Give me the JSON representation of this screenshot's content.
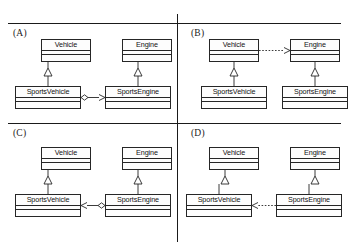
{
  "figure": {
    "line_color": "#1a1a1a",
    "box_border_color": "#262626",
    "box_fill_color": "#fdfdfd",
    "background_color": "#ffffff"
  },
  "classes": {
    "vehicle": "Vehicle",
    "engine": "Engine",
    "sports_vehicle": "SportsVehicle",
    "sports_engine": "SportsEngine"
  },
  "panels": [
    {
      "id": "a",
      "label": "(A)",
      "boxes": [
        {
          "name": "Vehicle",
          "role": "superclass-left"
        },
        {
          "name": "Engine",
          "role": "superclass-right"
        },
        {
          "name": "SportsVehicle",
          "role": "subclass-left"
        },
        {
          "name": "SportsEngine",
          "role": "subclass-right"
        }
      ],
      "relationships": [
        {
          "type": "generalization",
          "from": "SportsVehicle",
          "to": "Vehicle",
          "notation": "solid line with hollow triangle"
        },
        {
          "type": "generalization",
          "from": "SportsEngine",
          "to": "Engine",
          "notation": "solid line with hollow triangle"
        },
        {
          "type": "aggregation",
          "from": "SportsVehicle",
          "to": "SportsEngine",
          "notation": "solid line, hollow diamond at SportsVehicle, open arrowhead at SportsEngine"
        }
      ]
    },
    {
      "id": "b",
      "label": "(B)",
      "boxes": [
        {
          "name": "Vehicle",
          "role": "superclass-left"
        },
        {
          "name": "Engine",
          "role": "superclass-right"
        },
        {
          "name": "SportsVehicle",
          "role": "subclass-left"
        },
        {
          "name": "SportsEngine",
          "role": "subclass-right"
        }
      ],
      "relationships": [
        {
          "type": "generalization",
          "from": "SportsVehicle",
          "to": "Vehicle",
          "notation": "solid line with hollow triangle"
        },
        {
          "type": "generalization",
          "from": "SportsEngine",
          "to": "Engine",
          "notation": "solid line with hollow triangle"
        },
        {
          "type": "dependency",
          "from": "Vehicle",
          "to": "Engine",
          "notation": "dotted line with open arrowhead pointing right"
        }
      ]
    },
    {
      "id": "c",
      "label": "(C)",
      "boxes": [
        {
          "name": "Vehicle",
          "role": "superclass-left"
        },
        {
          "name": "Engine",
          "role": "superclass-right"
        },
        {
          "name": "SportsVehicle",
          "role": "subclass-left"
        },
        {
          "name": "SportsEngine",
          "role": "subclass-right"
        }
      ],
      "relationships": [
        {
          "type": "generalization",
          "from": "SportsVehicle",
          "to": "Vehicle",
          "notation": "solid line with hollow triangle"
        },
        {
          "type": "generalization",
          "from": "SportsEngine",
          "to": "Engine",
          "notation": "solid line with hollow triangle"
        },
        {
          "type": "aggregation",
          "from": "SportsEngine",
          "to": "SportsVehicle",
          "notation": "solid line, hollow diamond at SportsEngine, open arrowhead at SportsVehicle"
        }
      ]
    },
    {
      "id": "d",
      "label": "(D)",
      "boxes": [
        {
          "name": "Vehicle",
          "role": "superclass-left"
        },
        {
          "name": "Engine",
          "role": "superclass-right"
        },
        {
          "name": "SportsVehicle",
          "role": "subclass-left"
        },
        {
          "name": "SportsEngine",
          "role": "subclass-right"
        }
      ],
      "relationships": [
        {
          "type": "generalization",
          "from": "SportsVehicle",
          "to": "Vehicle",
          "notation": "solid line with hollow triangle"
        },
        {
          "type": "generalization",
          "from": "SportsEngine",
          "to": "Engine",
          "notation": "solid line with hollow triangle"
        },
        {
          "type": "dependency",
          "from": "SportsEngine",
          "to": "SportsVehicle",
          "notation": "dotted line with open arrowhead pointing left"
        }
      ]
    }
  ]
}
